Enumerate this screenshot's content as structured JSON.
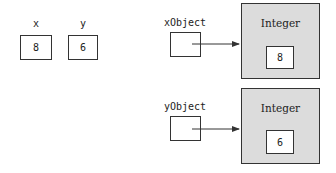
{
  "primitives": [
    {
      "name": "x",
      "value": "8"
    },
    {
      "name": "y",
      "value": "6"
    }
  ],
  "references": [
    {
      "name": "xObject",
      "points_to": 0
    },
    {
      "name": "yObject",
      "points_to": 1
    }
  ],
  "objects": [
    {
      "type": "Integer",
      "value": "8"
    },
    {
      "type": "Integer",
      "value": "6"
    }
  ],
  "colors": {
    "object_fill": "#dcdcdc",
    "stroke": "#333333"
  }
}
